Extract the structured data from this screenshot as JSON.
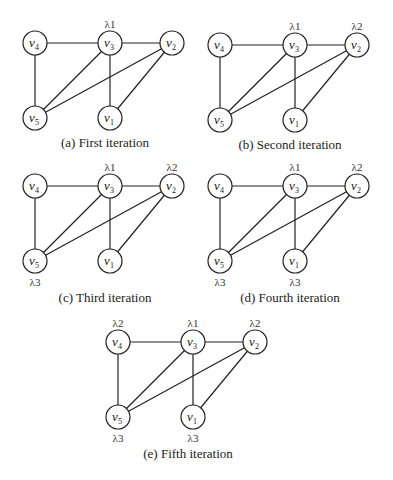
{
  "figure": {
    "nodes": [
      {
        "id": "v4",
        "name": "v",
        "sub": "4",
        "dx": 0,
        "dy": 0
      },
      {
        "id": "v3",
        "name": "v",
        "sub": "3",
        "dx": 75,
        "dy": 0
      },
      {
        "id": "v2",
        "name": "v",
        "sub": "2",
        "dx": 137,
        "dy": 0
      },
      {
        "id": "v5",
        "name": "v",
        "sub": "5",
        "dx": 0,
        "dy": 75
      },
      {
        "id": "v1",
        "name": "v",
        "sub": "1",
        "dx": 75,
        "dy": 75
      }
    ],
    "edges": [
      [
        "v4",
        "v3"
      ],
      [
        "v3",
        "v2"
      ],
      [
        "v4",
        "v5"
      ],
      [
        "v3",
        "v5"
      ],
      [
        "v3",
        "v1"
      ],
      [
        "v2",
        "v5"
      ],
      [
        "v2",
        "v1"
      ]
    ],
    "panels": [
      {
        "id": "a",
        "caption": "(a) First iteration",
        "origin": [
          35,
          43
        ],
        "labels": [
          {
            "node": "v3",
            "text": "λ1",
            "pos": "above"
          }
        ]
      },
      {
        "id": "b",
        "caption": "(b) Second iteration",
        "origin": [
          220,
          45
        ],
        "labels": [
          {
            "node": "v3",
            "text": "λ1",
            "pos": "above"
          },
          {
            "node": "v2",
            "text": "λ2",
            "pos": "above"
          }
        ]
      },
      {
        "id": "c",
        "caption": "(c) Third iteration",
        "origin": [
          35,
          186
        ],
        "labels": [
          {
            "node": "v3",
            "text": "λ1",
            "pos": "above"
          },
          {
            "node": "v2",
            "text": "λ2",
            "pos": "above"
          },
          {
            "node": "v5",
            "text": "λ3",
            "pos": "below"
          }
        ]
      },
      {
        "id": "d",
        "caption": "(d) Fourth iteration",
        "origin": [
          220,
          186
        ],
        "labels": [
          {
            "node": "v3",
            "text": "λ1",
            "pos": "above"
          },
          {
            "node": "v2",
            "text": "λ2",
            "pos": "above"
          },
          {
            "node": "v5",
            "text": "λ3",
            "pos": "below"
          },
          {
            "node": "v1",
            "text": "λ3",
            "pos": "below"
          }
        ]
      },
      {
        "id": "e",
        "caption": "(e) Fifth iteration",
        "origin": [
          118,
          342
        ],
        "labels": [
          {
            "node": "v4",
            "text": "λ2",
            "pos": "above"
          },
          {
            "node": "v3",
            "text": "λ1",
            "pos": "above"
          },
          {
            "node": "v2",
            "text": "λ2",
            "pos": "above"
          },
          {
            "node": "v5",
            "text": "λ3",
            "pos": "below"
          },
          {
            "node": "v1",
            "text": "λ3",
            "pos": "below"
          }
        ]
      }
    ]
  }
}
